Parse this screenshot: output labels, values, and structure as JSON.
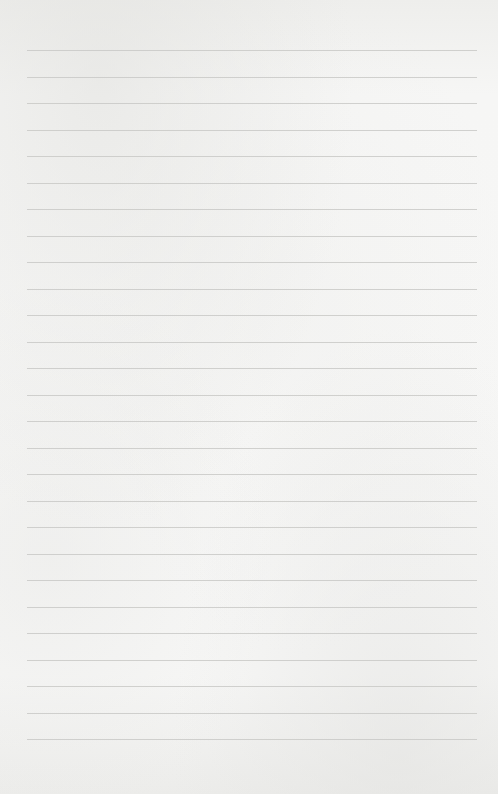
{
  "paper": {
    "type": "ruled-lined-paper",
    "background_color": "#f4f4f3",
    "line_color": "#c9c9c7",
    "line_count": 27,
    "first_line_y": 50,
    "line_spacing": 26.5,
    "line_left": 27,
    "line_right": 477,
    "text": ""
  }
}
